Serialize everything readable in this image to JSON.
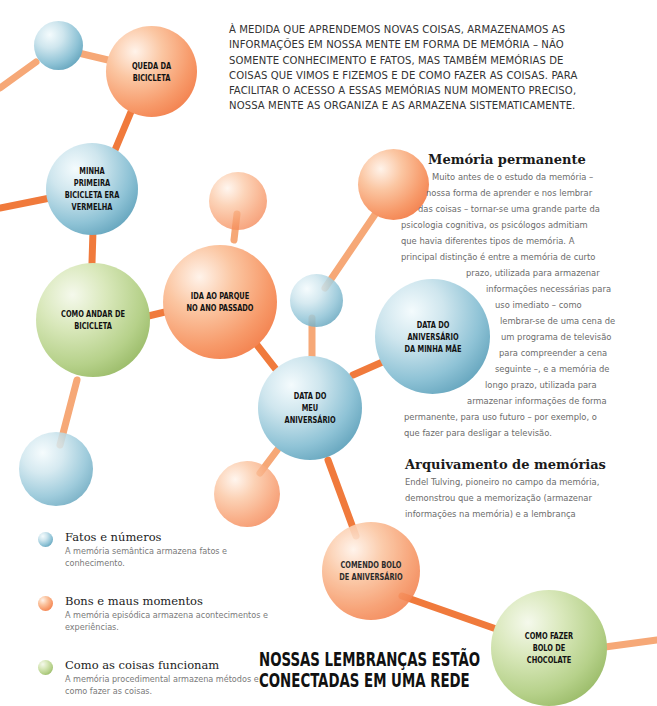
{
  "intro": {
    "lines": [
      "À MEDIDA QUE APRENDEMOS NOVAS COISAS, ARMAZENAMOS AS",
      "INFORMAÇÕES EM NOSSA MENTE EM FORMA DE MEMÓRIA – NÃO",
      "SOMENTE CONHECIMENTO E FATOS, MAS TAMBÉM MEMÓRIAS DE",
      "COISAS QUE VIMOS E FIZEMOS E DE COMO FAZER AS COISAS. PARA",
      "FACILITAR O ACESSO A ESSAS MEMÓRIAS NUM MOMENTO PRECISO,",
      "NOSSA MENTE AS ORGANIZA E AS ARMAZENA SISTEMATICAMENTE."
    ]
  },
  "section_permanent": {
    "title": "Memória permanente",
    "lines": [
      "Muito antes de o estudo da memória –",
      "nossa forma de aprender e nos lembrar",
      "das coisas – tornar-se uma grande parte da",
      "psicologia cognitiva, os psicólogos admitiam",
      "que havia diferentes tipos de memória. A",
      "principal distinção é entre a memória de curto",
      "prazo, utilizada para armazenar",
      "informações necessárias para",
      "uso imediato – como",
      "lembrar-se de uma cena de",
      "um programa de televisão",
      "para compreender a cena",
      "seguinte –, e a memória de",
      "longo prazo, utilizada para",
      "armazenar informações de forma",
      "permanente, para uso futuro – por exemplo, o",
      "que fazer para desligar a televisão."
    ]
  },
  "section_archive": {
    "title": "Arquivamento de memórias",
    "lines": [
      "Endel Tulving, pioneiro no campo da memória,",
      "demonstrou que a memorização (armazenar",
      "informações na memória) e a lembrança"
    ]
  },
  "spheres": {
    "queda": "QUEDA DA BICICLETA",
    "primeira": "MINHA PRIMEIRA BICICLETA ERA VERMELHA",
    "andar": "COMO ANDAR DE BICICLETA",
    "parque": "IDA AO PARQUE NO ANO PASSADO",
    "mae": "DATA DO ANIVERSÁRIO DA MINHA MÃE",
    "meu": "DATA DO MEU ANIVERSÁRIO",
    "comendo": "COMENDO BOLO DE ANIVERSÁRIO",
    "chocolate": "COMO FAZER BOLO DE CHOCOLATE"
  },
  "legend": [
    {
      "color": "blue",
      "title": "Fatos e números",
      "desc": "A memória semântica armazena fatos e conhecimento."
    },
    {
      "color": "orange",
      "title": "Bons e maus momentos",
      "desc": "A memória episódica armazena acontecimentos e experiências."
    },
    {
      "color": "green",
      "title": "Como as coisas funcionam",
      "desc": "A memória procedimental armazena métodos e como fazer as coisas."
    }
  ],
  "footer_title": {
    "line1": "NOSSAS LEMBRANÇAS ESTÃO",
    "line2": "CONECTADAS EM UMA REDE"
  },
  "colors": {
    "connector": "#f28a4a",
    "connector_light": "#f6a877",
    "blue": "#4a93b0",
    "orange": "#f07a45",
    "green": "#8fb457"
  }
}
